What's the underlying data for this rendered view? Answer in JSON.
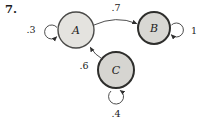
{
  "problem_number": "7.",
  "diagram": {
    "type": "state-transition-diagram",
    "states": [
      {
        "id": "A",
        "label": "A"
      },
      {
        "id": "B",
        "label": "B"
      },
      {
        "id": "C",
        "label": "C"
      }
    ],
    "transitions": [
      {
        "from": "A",
        "to": "A",
        "probability": ".3"
      },
      {
        "from": "A",
        "to": "B",
        "probability": ".7"
      },
      {
        "from": "B",
        "to": "B",
        "probability": "1"
      },
      {
        "from": "C",
        "to": "A",
        "probability": ".6"
      },
      {
        "from": "C",
        "to": "C",
        "probability": ".4"
      }
    ],
    "colors": {
      "state_a_fill": "#e4e3df",
      "state_b_fill": "#d8d7d3",
      "state_c_fill": "#d6d5d1",
      "edge_stroke": "#3a3a3a",
      "background": "#ffffff"
    }
  }
}
